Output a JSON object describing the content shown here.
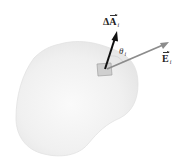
{
  "figure": {
    "surface": {
      "fill": "#f1f1f1",
      "edge": "#e4e4e4"
    },
    "patch": {
      "fill": "#cfcfcf",
      "stroke": "#9a9a9a"
    },
    "area_vector": {
      "color": "#111111",
      "prefix": "Δ",
      "symbol": "A",
      "subscript": "i"
    },
    "field_vector": {
      "color": "#8a8a8a",
      "symbol": "E",
      "subscript": "i"
    },
    "angle": {
      "symbol": "θ",
      "subscript": "i",
      "arc_color": "#bdbdbd"
    }
  }
}
